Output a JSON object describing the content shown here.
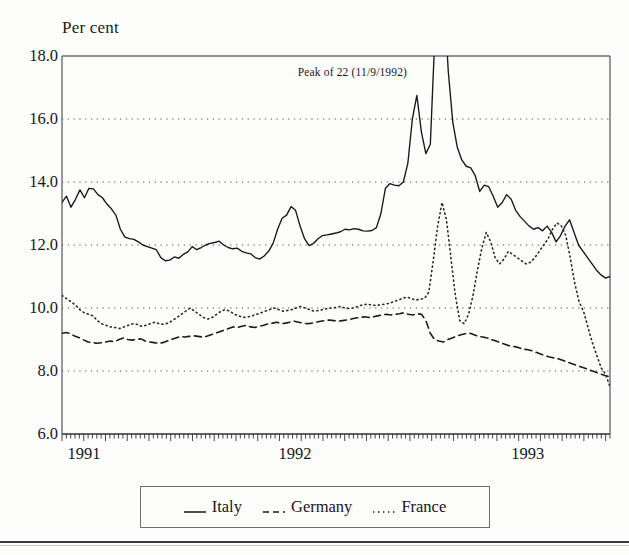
{
  "chart_data": {
    "type": "line",
    "title": "",
    "ylabel": "Per cent",
    "xlabel": "",
    "ylim": [
      6.0,
      18.0
    ],
    "ytick_labels": [
      "18.0",
      "16.0",
      "14.0",
      "12.0",
      "10.0",
      "8.0",
      "6.0"
    ],
    "ytick_values": [
      18.0,
      16.0,
      14.0,
      12.0,
      10.0,
      8.0,
      6.0
    ],
    "gridlines": [
      16.0,
      14.0,
      12.0,
      10.0,
      8.0
    ],
    "grid": "dotted-horizontal",
    "xtick_labels": [
      "1991",
      "1992",
      "1993"
    ],
    "xtick_positions": [
      0.0,
      0.425,
      0.85
    ],
    "xlim": [
      0,
      1
    ],
    "minor_ticks": "weekly",
    "legend_position": "below-plot",
    "annotations": [
      {
        "text": "Peak of 22 (11/9/1992)",
        "x_frac": 0.53,
        "y_value": 17.45
      }
    ],
    "series": [
      {
        "name": "Italy",
        "style": "solid",
        "color": "#16171b",
        "values": [
          13.35,
          13.55,
          13.2,
          13.45,
          13.75,
          13.5,
          13.8,
          13.78,
          13.6,
          13.5,
          13.3,
          13.15,
          12.95,
          12.5,
          12.25,
          12.2,
          12.18,
          12.1,
          12.0,
          11.95,
          11.9,
          11.85,
          11.6,
          11.5,
          11.52,
          11.62,
          11.58,
          11.7,
          11.78,
          11.95,
          11.85,
          11.92,
          12.0,
          12.05,
          12.08,
          12.12,
          12.0,
          11.92,
          11.88,
          11.9,
          11.8,
          11.75,
          11.72,
          11.6,
          11.55,
          11.65,
          11.8,
          12.05,
          12.5,
          12.85,
          12.95,
          13.22,
          13.1,
          12.6,
          12.2,
          11.98,
          12.05,
          12.2,
          12.3,
          12.32,
          12.35,
          12.38,
          12.42,
          12.5,
          12.48,
          12.52,
          12.5,
          12.45,
          12.44,
          12.46,
          12.55,
          13.0,
          13.8,
          13.95,
          13.9,
          13.88,
          14.0,
          14.6,
          16.0,
          16.75,
          15.6,
          14.9,
          15.2,
          18.6,
          22.0,
          20.0,
          17.5,
          15.9,
          15.1,
          14.7,
          14.5,
          14.45,
          14.2,
          13.7,
          13.9,
          13.85,
          13.55,
          13.2,
          13.35,
          13.6,
          13.45,
          13.1,
          12.9,
          12.75,
          12.6,
          12.5,
          12.55,
          12.45,
          12.6,
          12.4,
          12.1,
          12.3,
          12.6,
          12.8,
          12.4,
          12.0,
          11.8,
          11.6,
          11.4,
          11.2,
          11.05,
          10.95,
          11.0
        ]
      },
      {
        "name": "Germany",
        "style": "dashed",
        "color": "#1a1b1f",
        "values": [
          9.2,
          9.22,
          9.18,
          9.1,
          9.05,
          8.98,
          8.92,
          8.9,
          8.88,
          8.9,
          8.92,
          8.95,
          8.93,
          9.0,
          9.05,
          9.0,
          8.98,
          9.0,
          9.02,
          8.95,
          8.92,
          8.9,
          8.88,
          8.9,
          8.95,
          9.0,
          9.05,
          9.1,
          9.08,
          9.1,
          9.12,
          9.1,
          9.08,
          9.1,
          9.15,
          9.2,
          9.25,
          9.3,
          9.35,
          9.4,
          9.38,
          9.42,
          9.45,
          9.4,
          9.38,
          9.42,
          9.45,
          9.5,
          9.52,
          9.55,
          9.5,
          9.52,
          9.55,
          9.58,
          9.55,
          9.52,
          9.5,
          9.52,
          9.55,
          9.58,
          9.6,
          9.62,
          9.6,
          9.58,
          9.6,
          9.62,
          9.65,
          9.68,
          9.7,
          9.72,
          9.7,
          9.72,
          9.75,
          9.78,
          9.8,
          9.78,
          9.8,
          9.82,
          9.85,
          9.8,
          9.78,
          9.82,
          9.8,
          9.6,
          9.2,
          9.0,
          8.95,
          8.92,
          9.0,
          9.05,
          9.1,
          9.15,
          9.18,
          9.2,
          9.15,
          9.1,
          9.08,
          9.05,
          9.0,
          8.95,
          8.9,
          8.85,
          8.8,
          8.78,
          8.75,
          8.7,
          8.68,
          8.65,
          8.6,
          8.55,
          8.5,
          8.45,
          8.42,
          8.4,
          8.35,
          8.3,
          8.25,
          8.2,
          8.15,
          8.1,
          8.05,
          8.0,
          7.95,
          7.9,
          7.85,
          7.82
        ]
      },
      {
        "name": "France",
        "style": "dotted",
        "color": "#26272b",
        "values": [
          10.4,
          10.3,
          10.2,
          10.1,
          9.95,
          9.85,
          9.8,
          9.75,
          9.6,
          9.5,
          9.45,
          9.4,
          9.38,
          9.35,
          9.4,
          9.45,
          9.5,
          9.48,
          9.42,
          9.45,
          9.5,
          9.55,
          9.5,
          9.48,
          9.52,
          9.6,
          9.7,
          9.8,
          9.9,
          10.0,
          9.9,
          9.8,
          9.7,
          9.65,
          9.7,
          9.8,
          9.9,
          9.95,
          9.9,
          9.8,
          9.75,
          9.7,
          9.72,
          9.75,
          9.8,
          9.85,
          9.9,
          9.95,
          10.0,
          9.95,
          9.9,
          9.92,
          9.95,
          10.0,
          10.05,
          10.0,
          9.95,
          9.9,
          9.92,
          9.95,
          9.98,
          10.0,
          10.02,
          10.05,
          10.0,
          9.98,
          10.0,
          10.05,
          10.1,
          10.12,
          10.1,
          10.08,
          10.1,
          10.12,
          10.15,
          10.2,
          10.25,
          10.3,
          10.35,
          10.3,
          10.25,
          10.28,
          10.3,
          10.5,
          11.5,
          12.6,
          13.35,
          12.8,
          11.6,
          10.4,
          9.6,
          9.5,
          9.8,
          10.4,
          11.2,
          11.9,
          12.4,
          12.1,
          11.6,
          11.4,
          11.55,
          11.8,
          11.7,
          11.6,
          11.5,
          11.4,
          11.45,
          11.6,
          11.8,
          12.0,
          12.2,
          12.5,
          12.7,
          12.6,
          12.3,
          11.6,
          10.8,
          10.2,
          9.9,
          9.4,
          8.9,
          8.5,
          8.1,
          7.9,
          7.5
        ]
      }
    ]
  },
  "legend": {
    "items": [
      {
        "label": "Italy",
        "style": "solid"
      },
      {
        "label": "Germany",
        "style": "dashed"
      },
      {
        "label": "France",
        "style": "dotted"
      }
    ]
  }
}
